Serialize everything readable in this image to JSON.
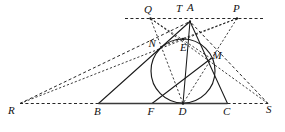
{
  "figure": {
    "type": "geometry-diagram",
    "width": 285,
    "height": 132,
    "background_color": "#ffffff",
    "ink_color": "#1a1a1a",
    "labels": {
      "Q": "Q",
      "T": "T",
      "A": "A",
      "P": "P",
      "N": "N",
      "E": "E",
      "M": "M",
      "R": "R",
      "B": "B",
      "F": "F",
      "D": "D",
      "C": "C",
      "S": "S"
    },
    "points": {
      "Q": {
        "x": 150.5,
        "y": 18.5
      },
      "T": {
        "x": 183.0,
        "y": 39.0
      },
      "A": {
        "x": 190.0,
        "y": 21.5
      },
      "P": {
        "x": 237.0,
        "y": 18.5
      },
      "N": {
        "x": 158.5,
        "y": 47.5
      },
      "E": {
        "x": 183.0,
        "y": 44.0
      },
      "M": {
        "x": 211.0,
        "y": 58.5
      },
      "R": {
        "x": 20.0,
        "y": 103.5
      },
      "B": {
        "x": 98.5,
        "y": 103.5
      },
      "F": {
        "x": 152.0,
        "y": 103.5
      },
      "D": {
        "x": 183.0,
        "y": 103.5
      },
      "C": {
        "x": 227.5,
        "y": 103.5
      },
      "S": {
        "x": 268.0,
        "y": 103.5
      }
    },
    "label_positions": {
      "Q": {
        "x": 144.0,
        "y": 3.5
      },
      "T": {
        "x": 176.0,
        "y": 3.0
      },
      "A": {
        "x": 187.0,
        "y": 2.0
      },
      "P": {
        "x": 233.0,
        "y": 2.5
      },
      "N": {
        "x": 148.5,
        "y": 37.5
      },
      "E": {
        "x": 180.0,
        "y": 42.0
      },
      "M": {
        "x": 212.5,
        "y": 50.0
      },
      "R": {
        "x": 8.0,
        "y": 105.0
      },
      "B": {
        "x": 94.0,
        "y": 105.5
      },
      "F": {
        "x": 147.5,
        "y": 105.5
      },
      "D": {
        "x": 178.5,
        "y": 105.5
      },
      "C": {
        "x": 223.0,
        "y": 105.5
      },
      "S": {
        "x": 266.0,
        "y": 104.0
      }
    },
    "circle": {
      "cx": 183.0,
      "cy": 71.0,
      "r": 32.0
    },
    "solid_segments": [
      {
        "name": "side-AB",
        "from": "A",
        "to": "B"
      },
      {
        "name": "side-AC",
        "from": "A",
        "to": "C"
      },
      {
        "name": "median-AD",
        "from": "A",
        "to": "D"
      },
      {
        "name": "cevian-FM",
        "from": "F",
        "to": "M"
      }
    ],
    "thick_segments": [
      {
        "name": "base-BC",
        "from": "B",
        "to": "C"
      }
    ],
    "dashed_segments": [
      {
        "name": "tangent-line-QP",
        "from": {
          "x": 125.0,
          "y": 18.5
        },
        "to": {
          "x": 264.0,
          "y": 18.5
        }
      },
      {
        "name": "base-extension-RB",
        "from": "R",
        "to": "B"
      },
      {
        "name": "base-extension-CS",
        "from": "C",
        "to": "S"
      },
      {
        "name": "ray-RA",
        "from": "R",
        "to": "A"
      },
      {
        "name": "ray-SA",
        "from": "S",
        "to": "A"
      },
      {
        "name": "ray-RP",
        "from": "R",
        "to": "P"
      },
      {
        "name": "ray-SQ",
        "from": "S",
        "to": "Q"
      },
      {
        "name": "chord-QD",
        "from": "Q",
        "to": "D"
      },
      {
        "name": "chord-PD",
        "from": "P",
        "to": "D"
      },
      {
        "name": "chord-QM",
        "from": "Q",
        "to": "M"
      },
      {
        "name": "chord-PN",
        "from": "P",
        "to": "N"
      }
    ],
    "marked_dots": [
      {
        "name": "dot-Q",
        "at": "Q"
      },
      {
        "name": "dot-A",
        "at": "A"
      },
      {
        "name": "dot-P",
        "at": "P"
      },
      {
        "name": "dot-T",
        "at": "T"
      },
      {
        "name": "dot-D",
        "at": "D"
      }
    ]
  }
}
